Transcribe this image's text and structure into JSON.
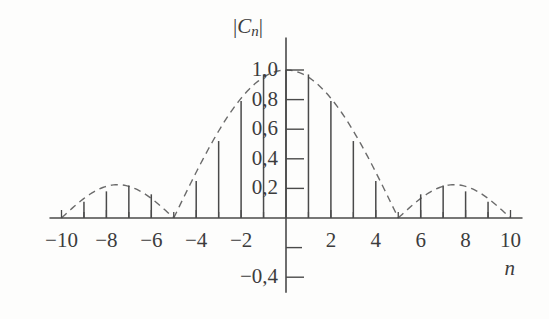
{
  "chart_data": {
    "type": "bar",
    "title": "",
    "subtitle": "",
    "xlabel": "n",
    "ylabel": "|C_n|",
    "ylabel_parts": {
      "bar_open": "|",
      "letter": "C",
      "subscript": "n",
      "bar_close": "|"
    },
    "xlim": [
      -10.6,
      10.6
    ],
    "ylim": [
      -0.5,
      1.12
    ],
    "grid": false,
    "legend": null,
    "decimal_separator": ",",
    "x_tick_labels": [
      "−10",
      "−8",
      "−6",
      "−4",
      "−2",
      "2",
      "4",
      "6",
      "8",
      "10"
    ],
    "x_tick_values": [
      -10,
      -8,
      -6,
      -4,
      -2,
      2,
      4,
      6,
      8,
      10
    ],
    "x_minor_tick_values": [
      -9,
      -7,
      -5,
      -3,
      -1,
      1,
      3,
      5,
      7,
      9
    ],
    "y_tick_labels": [
      "1,0",
      "0,8",
      "0,6",
      "0,4",
      "0,2",
      "−0,4"
    ],
    "y_tick_values": [
      1.0,
      0.8,
      0.6,
      0.4,
      0.2,
      -0.4
    ],
    "y_minor_tick_values": [
      -0.2
    ],
    "categories": [
      -10,
      -9,
      -8,
      -7,
      -6,
      -5,
      -4,
      -3,
      -2,
      -1,
      0,
      1,
      2,
      3,
      4,
      5,
      6,
      7,
      8,
      9,
      10
    ],
    "values": [
      0.0,
      0.11,
      0.18,
      0.22,
      0.16,
      0.0,
      0.25,
      0.52,
      0.79,
      0.97,
      1.0,
      0.97,
      0.79,
      0.52,
      0.25,
      0.0,
      0.16,
      0.22,
      0.18,
      0.11,
      0.0
    ],
    "series": [
      {
        "name": "|C_n| stems",
        "style": "solid-stems",
        "values": [
          0.0,
          0.11,
          0.18,
          0.22,
          0.16,
          0.0,
          0.25,
          0.52,
          0.79,
          0.97,
          1.0,
          0.97,
          0.79,
          0.52,
          0.25,
          0.0,
          0.16,
          0.22,
          0.18,
          0.11,
          0.0
        ]
      },
      {
        "name": "envelope",
        "style": "dashed-curve",
        "note": "sinc-like magnitude envelope, zero crossings at n = ±5 and n = ±10"
      }
    ],
    "annotations": [],
    "colors": {
      "background": "#fdfdfc",
      "axis": "#4a4a4a",
      "stem": "#4a4a4a",
      "envelope": "#6b6b6b",
      "text": "#3c3c3c"
    }
  },
  "axes": {
    "x_axis_name": "n",
    "y_axis_name": "|Cn|"
  }
}
